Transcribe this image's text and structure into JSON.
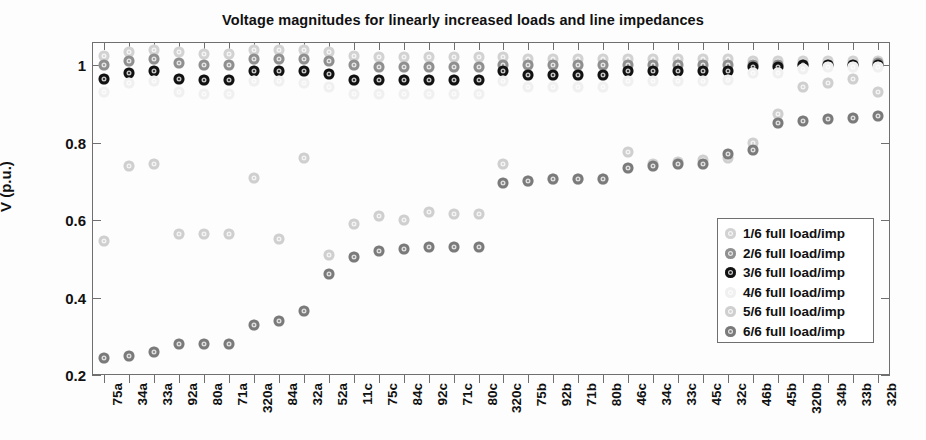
{
  "chart_data": {
    "type": "scatter",
    "title": "Voltage magnitudes for linearly increased loads and line impedances",
    "xlabel": "",
    "ylabel": "V (p.u.)",
    "ylim": [
      0.2,
      1.06
    ],
    "yticks": [
      "0.2",
      "0.4",
      "0.6",
      "0.8",
      "1"
    ],
    "ytick_values": [
      0.2,
      0.4,
      0.6,
      0.8,
      1.0
    ],
    "grid": false,
    "legend_position": "right-lower",
    "categories": [
      "75a",
      "34a",
      "33a",
      "92a",
      "80a",
      "71a",
      "320a",
      "84a",
      "32a",
      "52a",
      "11c",
      "75c",
      "84c",
      "92c",
      "71c",
      "80c",
      "320c",
      "75b",
      "92b",
      "71b",
      "80b",
      "46c",
      "34c",
      "33c",
      "45c",
      "32c",
      "46b",
      "45b",
      "320b",
      "34b",
      "33b",
      "32b"
    ],
    "series": [
      {
        "name": "1/6 full load/imp",
        "color": "#d2d2d2",
        "values": [
          1.025,
          1.035,
          1.04,
          1.035,
          1.03,
          1.03,
          1.04,
          1.04,
          1.04,
          1.035,
          1.025,
          1.02,
          1.02,
          1.02,
          1.02,
          1.02,
          1.02,
          1.015,
          1.015,
          1.015,
          1.015,
          1.015,
          1.015,
          1.015,
          1.015,
          1.015,
          1.01,
          1.01,
          1.01,
          1.01,
          1.01,
          1.01
        ]
      },
      {
        "name": "2/6 full load/imp",
        "color": "#8f8f8f",
        "values": [
          1.0,
          1.01,
          1.015,
          1.005,
          1.0,
          1.0,
          1.015,
          1.015,
          1.015,
          1.01,
          1.0,
          0.995,
          0.995,
          0.995,
          0.995,
          0.995,
          1.0,
          1.0,
          1.0,
          1.0,
          1.0,
          1.0,
          1.0,
          1.0,
          1.0,
          1.0,
          1.0,
          1.0,
          1.0,
          1.0,
          1.0,
          1.005
        ]
      },
      {
        "name": "3/6 full load/imp",
        "color": "#111111",
        "values": [
          0.965,
          0.98,
          0.985,
          0.965,
          0.962,
          0.962,
          0.985,
          0.985,
          0.985,
          0.978,
          0.962,
          0.962,
          0.962,
          0.962,
          0.962,
          0.962,
          0.985,
          0.975,
          0.975,
          0.975,
          0.975,
          0.985,
          0.985,
          0.985,
          0.985,
          0.985,
          0.995,
          0.995,
          1.0,
          1.0,
          1.0,
          1.0
        ]
      },
      {
        "name": "4/6 full load/imp",
        "color": "#f0f0f0",
        "values": [
          0.93,
          0.955,
          0.96,
          0.93,
          0.925,
          0.925,
          0.96,
          0.96,
          0.955,
          0.945,
          0.925,
          0.925,
          0.925,
          0.925,
          0.925,
          0.925,
          0.96,
          0.945,
          0.945,
          0.945,
          0.945,
          0.96,
          0.96,
          0.96,
          0.96,
          0.962,
          0.98,
          0.98,
          0.99,
          0.995,
          0.995,
          0.995
        ]
      },
      {
        "name": "5/6 full load/imp",
        "color": "#cfcfcf",
        "values": [
          0.545,
          0.74,
          0.745,
          0.565,
          0.565,
          0.565,
          0.71,
          0.55,
          0.76,
          0.51,
          0.59,
          0.61,
          0.6,
          0.62,
          0.615,
          0.615,
          0.745,
          0.7,
          0.705,
          0.705,
          0.705,
          0.775,
          0.745,
          0.75,
          0.755,
          0.76,
          0.8,
          0.875,
          0.945,
          0.955,
          0.965,
          0.93
        ]
      },
      {
        "name": "6/6 full load/imp",
        "color": "#7a7a7a",
        "values": [
          0.245,
          0.25,
          0.26,
          0.28,
          0.28,
          0.28,
          0.33,
          0.34,
          0.365,
          0.46,
          0.505,
          0.52,
          0.525,
          0.53,
          0.53,
          0.53,
          0.695,
          0.7,
          0.705,
          0.705,
          0.705,
          0.735,
          0.74,
          0.745,
          0.745,
          0.77,
          0.78,
          0.85,
          0.855,
          0.86,
          0.865,
          0.87
        ]
      }
    ]
  },
  "legend": {
    "entries": [
      {
        "label": "1/6 full load/imp",
        "color": "#d2d2d2"
      },
      {
        "label": "2/6 full load/imp",
        "color": "#8f8f8f"
      },
      {
        "label": "3/6 full load/imp",
        "color": "#111111"
      },
      {
        "label": "4/6 full load/imp",
        "color": "#f0f0f0"
      },
      {
        "label": "5/6 full load/imp",
        "color": "#cfcfcf"
      },
      {
        "label": "6/6 full load/imp",
        "color": "#7a7a7a"
      }
    ]
  },
  "axes": {
    "frame_color": "#6f6f6f"
  }
}
